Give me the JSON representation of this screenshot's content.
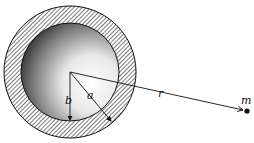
{
  "diagram": {
    "labels": {
      "inner_radius": "b",
      "outer_radius": "a",
      "distance": "r",
      "mass": "m"
    },
    "colors": {
      "ink": "#111111",
      "background": "#ffffff"
    }
  }
}
